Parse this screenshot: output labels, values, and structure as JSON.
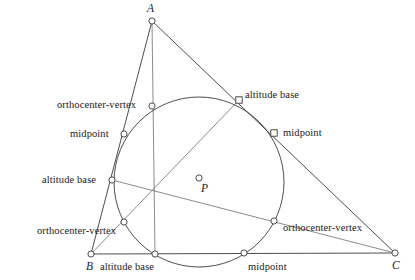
{
  "figure": {
    "stroke_color": "#3a3a3a",
    "marker_fill": "#ffffff",
    "background": "#ffffff"
  },
  "triangle": {
    "vertices": [
      {
        "name": "A",
        "label": "A",
        "x": 152,
        "y": 21,
        "label_x": 147,
        "label_y": 4
      },
      {
        "name": "B",
        "label": "B",
        "x": 91,
        "y": 254,
        "label_x": 86,
        "label_y": 262
      },
      {
        "name": "C",
        "label": "C",
        "x": 395,
        "y": 253,
        "label_x": 392,
        "label_y": 261
      }
    ]
  },
  "circle": {
    "name": "nine-point-circle",
    "center_x": 199,
    "center_y": 182,
    "radius": 85,
    "center_point": {
      "label": "P",
      "x": 199,
      "y": 178,
      "label_x": 201,
      "label_y": 183
    }
  },
  "points": [
    {
      "id": "orthocenter-vertex-a",
      "label": "orthocenter-vertex",
      "marker": "circle",
      "x": 152,
      "y": 106,
      "label_x": 57,
      "label_y": 99
    },
    {
      "id": "altitude-base-a",
      "label": "altitude base",
      "marker": "square",
      "x": 239,
      "y": 100,
      "label_x": 245,
      "label_y": 89
    },
    {
      "id": "midpoint-ab",
      "label": "midpoint",
      "marker": "circle",
      "x": 124,
      "y": 134,
      "label_x": 70,
      "label_y": 129
    },
    {
      "id": "midpoint-ac",
      "label": "midpoint",
      "marker": "square",
      "x": 274,
      "y": 133,
      "label_x": 282,
      "label_y": 127
    },
    {
      "id": "altitude-base-b",
      "label": "altitude base",
      "marker": "circle",
      "x": 112,
      "y": 180,
      "label_x": 42,
      "label_y": 175
    },
    {
      "id": "orthocenter-vertex-b",
      "label": "orthocenter-vertex",
      "marker": "circle",
      "x": 124,
      "y": 222,
      "label_x": 37,
      "label_y": 226
    },
    {
      "id": "orthocenter-vertex-c",
      "label": "orthocenter-vertex",
      "marker": "circle",
      "x": 274,
      "y": 221,
      "label_x": 282,
      "label_y": 223
    },
    {
      "id": "altitude-base-c",
      "label": "altitude base",
      "marker": "circle",
      "x": 155,
      "y": 254,
      "label_x": 99,
      "label_y": 262
    },
    {
      "id": "midpoint-bc",
      "label": "midpoint",
      "marker": "circle",
      "x": 244,
      "y": 253,
      "label_x": 248,
      "label_y": 262
    }
  ]
}
